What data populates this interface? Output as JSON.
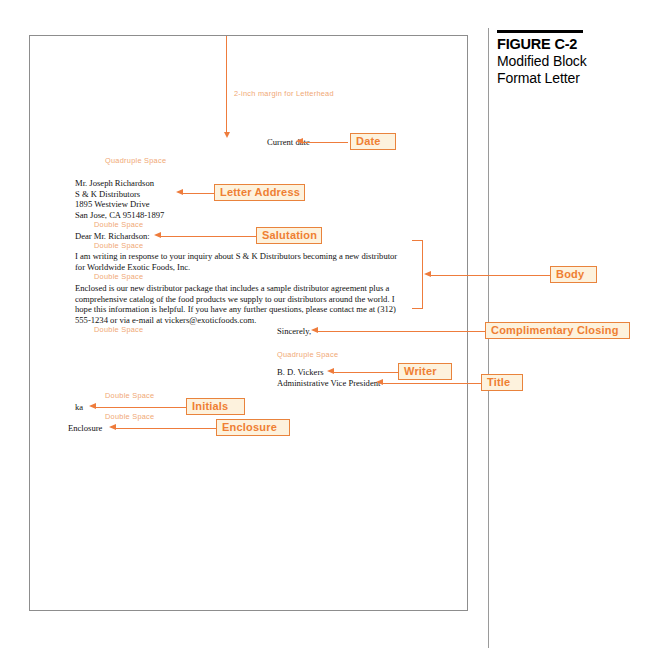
{
  "figure": {
    "number": "FIGURE C-2",
    "title_line1": "Modified Block",
    "title_line2": "Format Letter"
  },
  "letter": {
    "margin_note": "2-inch margin for Letterhead",
    "date_line": "Current date",
    "quadruple_space_1": "Quadruple Space",
    "address": [
      "Mr. Joseph Richardson",
      "S & K Distributors",
      "1895 Westview Drive",
      "San Jose, CA 95148-1897"
    ],
    "double_space_1": "Double Space",
    "salutation": "Dear Mr. Richardson:",
    "double_space_2": "Double Space",
    "body_paragraph_1_line1": "I am writing in response to your inquiry about S & K Distributors becoming a new distributor",
    "body_paragraph_1_line2": "for Worldwide Exotic Foods, Inc.",
    "double_space_3": "Double Space",
    "body_paragraph_2_line1": "Enclosed is our new distributor package that includes a sample distributor agreement plus a",
    "body_paragraph_2_line2": "comprehensive catalog of the food products we supply to our distributors around the world. I",
    "body_paragraph_2_line3": "hope this information is helpful. If you have any further questions, please contact me at (312)",
    "body_paragraph_2_line4": "555-1234 or via e-mail at vickers@exoticfoods.com.",
    "double_space_4": "Double Space",
    "complimentary_closing": "Sincerely,",
    "quadruple_space_2": "Quadruple Space",
    "writer_name": "B. D. Vickers",
    "writer_title": "Administrative Vice President",
    "double_space_5": "Double Space",
    "initials": "ka",
    "double_space_6": "Double Space",
    "enclosure": "Enclosure"
  },
  "callouts": {
    "date": "Date",
    "letter_address": "Letter Address",
    "salutation": "Salutation",
    "body": "Body",
    "complimentary_closing": "Complimentary Closing",
    "writer": "Writer",
    "title": "Title",
    "initials": "Initials",
    "enclosure": "Enclosure"
  },
  "colors": {
    "accent_orange": "#ee7c3c",
    "callout_fill": "#fdf2dd",
    "callout_border": "#e9833c",
    "space_note": "#f0a875",
    "page_border": "#8d8d8d",
    "rule_gray": "#9a9a9a",
    "text_black": "#111111"
  }
}
